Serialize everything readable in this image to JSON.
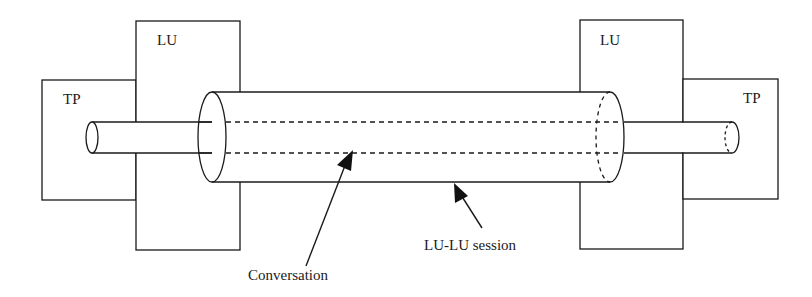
{
  "diagram": {
    "left_tp_label": "TP",
    "left_lu_label": "LU",
    "right_lu_label": "LU",
    "right_tp_label": "TP",
    "conversation_label": "Conversation",
    "session_label": "LU-LU session"
  }
}
